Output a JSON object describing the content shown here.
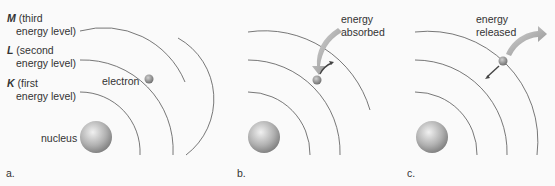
{
  "panels": [
    {
      "id": "a",
      "label": "a.",
      "levels": [
        {
          "letter": "M",
          "line1": "(third",
          "line2": "energy level)"
        },
        {
          "letter": "L",
          "line1": "(second",
          "line2": "energy level)"
        },
        {
          "letter": "K",
          "line1": "(first",
          "line2": "energy level)"
        }
      ],
      "electron_label": "electron",
      "nucleus_label": "nucleus"
    },
    {
      "id": "b",
      "label": "b.",
      "energy_label_1": "energy",
      "energy_label_2": "absorbed"
    },
    {
      "id": "c",
      "label": "c.",
      "energy_label_1": "energy",
      "energy_label_2": "released"
    }
  ],
  "colors": {
    "orbit": "#555555",
    "nucleus": "#a8a8a8",
    "electron": "#8a8a8a",
    "energy_arrow": "#a0a0a0",
    "electron_arrow": "#444444"
  }
}
